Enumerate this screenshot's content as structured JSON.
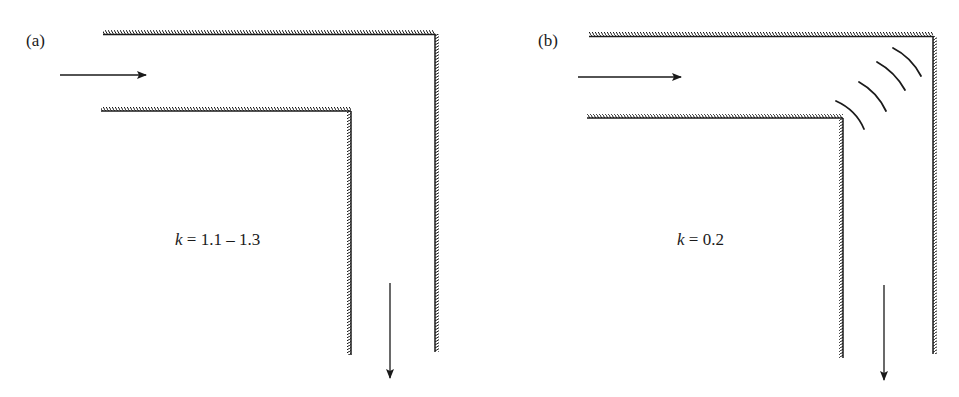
{
  "figure": {
    "panels": [
      {
        "id": "a",
        "label": "(a)",
        "description": "Sharp 90-degree elbow without guide vanes",
        "k_symbol": "k",
        "k_expr": " = 1.1 – 1.3",
        "guide_vanes": 0
      },
      {
        "id": "b",
        "label": "(b)",
        "description": "Sharp 90-degree elbow with turning guide vanes",
        "k_symbol": "k",
        "k_expr": " = 0.2",
        "guide_vanes": 4
      }
    ],
    "colors": {
      "line": "#1a1a1a",
      "background": "#ffffff"
    }
  }
}
